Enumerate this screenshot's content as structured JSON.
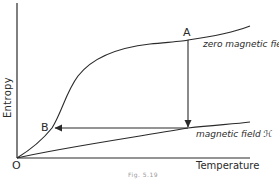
{
  "figure": {
    "caption": "Fig. 5.19",
    "axes": {
      "x_label": "Temperature",
      "y_label": "Entropy",
      "origin_label": "O"
    },
    "curves": [
      {
        "id": "zero-field",
        "label": "zero magnetic field"
      },
      {
        "id": "applied-field",
        "label": "magnetic field ℋ"
      }
    ],
    "points": [
      {
        "id": "A",
        "label": "A"
      },
      {
        "id": "B",
        "label": "B"
      }
    ],
    "process": [
      {
        "from": "A",
        "to": "magnetic field curve",
        "type": "isothermal magnetization (vertical arrow down)"
      },
      {
        "from": "magnetic field curve",
        "to": "B",
        "type": "adiabatic demagnetization (horizontal arrow left)"
      }
    ],
    "colors": {
      "ink": "#2a2a2a",
      "background": "#ffffff",
      "caption": "#9a9a9a"
    }
  }
}
